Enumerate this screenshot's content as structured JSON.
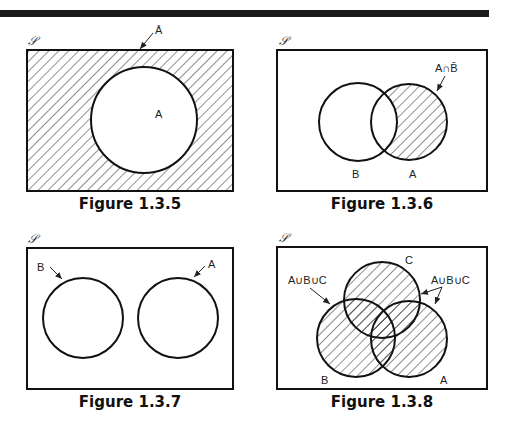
{
  "header_bar": {
    "color": "#1a1a1a"
  },
  "figures": [
    {
      "id": "fig-1-3-5",
      "caption": "Figure 1.3.5",
      "universe_label": "𝒮",
      "shaded_region": "complement of A",
      "annotation": "Ā",
      "sets": [
        {
          "name": "A",
          "label": "A"
        }
      ]
    },
    {
      "id": "fig-1-3-6",
      "caption": "Figure 1.3.6",
      "universe_label": "𝒮",
      "shaded_region": "A minus B",
      "annotation": "A∩B̄",
      "sets": [
        {
          "name": "B",
          "label": "B"
        },
        {
          "name": "A",
          "label": "A"
        }
      ]
    },
    {
      "id": "fig-1-3-7",
      "caption": "Figure 1.3.7",
      "universe_label": "𝒮",
      "shaded_region": "none (disjoint sets)",
      "sets": [
        {
          "name": "B",
          "label": "B"
        },
        {
          "name": "A",
          "label": "A"
        }
      ]
    },
    {
      "id": "fig-1-3-8",
      "caption": "Figure 1.3.8",
      "universe_label": "𝒮",
      "shaded_region": "A union B union C",
      "annotation_left": "A∪B∪C",
      "annotation_right": "A∪B∪C",
      "sets": [
        {
          "name": "C",
          "label": "C"
        },
        {
          "name": "B",
          "label": "B"
        },
        {
          "name": "A",
          "label": "A"
        }
      ]
    }
  ]
}
